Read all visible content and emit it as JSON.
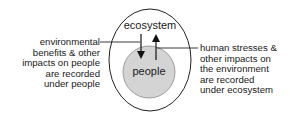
{
  "diagram": {
    "outer": {
      "label": "ecosystem",
      "stroke": "#222222",
      "fill": "#ffffff"
    },
    "inner": {
      "label": "people",
      "stroke": "#777777",
      "fill": "#d4d4d4"
    },
    "left_annotation": {
      "lines": [
        "environmental",
        "benefits & other",
        "impacts on people",
        "are recorded",
        "under people"
      ],
      "arrow_direction": "down"
    },
    "right_annotation": {
      "lines": [
        "human stresses &",
        "other impacts on",
        "the environment",
        "are recorded",
        "under ecosystem"
      ],
      "arrow_direction": "up"
    }
  }
}
